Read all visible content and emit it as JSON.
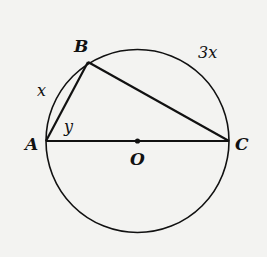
{
  "diagram": {
    "points": {
      "A": "A",
      "B": "B",
      "C": "C",
      "O": "O"
    },
    "arc_labels": {
      "AB": "x",
      "BC": "3x"
    },
    "angle_labels": {
      "BAC": "y"
    },
    "colors": {
      "stroke": "#111111",
      "background": "#f3f3f1"
    }
  }
}
